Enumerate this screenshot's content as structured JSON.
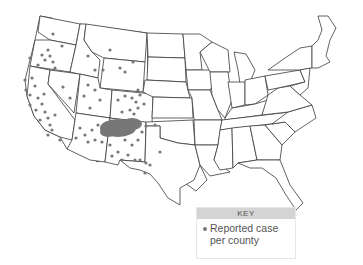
{
  "map": {
    "title": "",
    "region": "Contiguous United States",
    "marker_color": "#777777",
    "border_color": "#3a3a3a"
  },
  "key": {
    "header": "KEY",
    "items": [
      {
        "symbol": "dot",
        "label": "Reported case per county",
        "line1": "Reported case",
        "line2": "per county"
      }
    ]
  }
}
